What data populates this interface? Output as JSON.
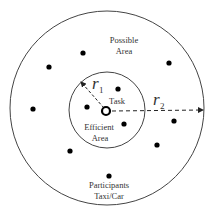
{
  "diagram": {
    "colors": {
      "stroke": "#333333",
      "dot": "#000000",
      "background": "#ffffff"
    },
    "outer_circle": {
      "cx": 107,
      "cy": 108,
      "r": 97
    },
    "inner_circle": {
      "cx": 107,
      "cy": 110,
      "r": 38
    },
    "task_marker": {
      "cx": 106,
      "cy": 111
    },
    "labels": {
      "possible_line1": "Possible",
      "possible_line2": "Area",
      "task": "Task",
      "efficient_line1": "Efficient",
      "efficient_line2": "Area",
      "participants_line1": "Participants",
      "participants_line2": "Taxi/Car",
      "r1_letter": "r",
      "r1_sub": "1",
      "r2_letter": "r",
      "r2_sub": "2"
    },
    "participants": [
      {
        "x": 83,
        "y": 53
      },
      {
        "x": 49,
        "y": 67
      },
      {
        "x": 169,
        "y": 63
      },
      {
        "x": 118,
        "y": 89
      },
      {
        "x": 33,
        "y": 109
      },
      {
        "x": 87,
        "y": 107
      },
      {
        "x": 124,
        "y": 124
      },
      {
        "x": 174,
        "y": 121
      },
      {
        "x": 157,
        "y": 145
      },
      {
        "x": 70,
        "y": 151
      },
      {
        "x": 109,
        "y": 176
      }
    ]
  }
}
